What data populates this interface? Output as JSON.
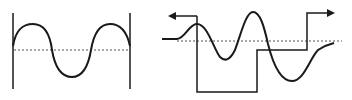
{
  "diagram": {
    "colors": {
      "line": "#1a1a1a",
      "dotted": "#555555",
      "background": "#ffffff"
    },
    "left_figure": {
      "name": "sine-wave-between-bars",
      "baseline_y": 50
    },
    "right_figure": {
      "name": "wave-with-square-pulse",
      "baseline_y": 41,
      "arrows": [
        "left-arrow",
        "right-arrow"
      ]
    }
  }
}
